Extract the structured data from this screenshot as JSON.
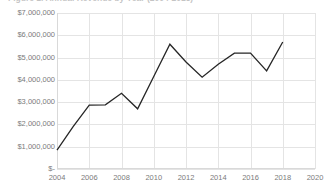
{
  "chart": {
    "title": "Figure 1. Annual Revenue by Year (2004-2018)"
  },
  "chart_data": {
    "type": "line",
    "title": "Figure 1. Annual Revenue by Year (2004-2018)",
    "xlabel": "",
    "ylabel": "",
    "grid": true,
    "legend": false,
    "xlim": [
      2004,
      2020
    ],
    "ylim": [
      0,
      7000000
    ],
    "x_tick_labels": [
      "2004",
      "2006",
      "2008",
      "2010",
      "2012",
      "2014",
      "2016",
      "2018",
      "2020"
    ],
    "x_tick_values": [
      2004,
      2006,
      2008,
      2010,
      2012,
      2014,
      2016,
      2018,
      2020
    ],
    "y_tick_labels": [
      "$-",
      "$1,000,000",
      "$2,000,000",
      "$3,000,000",
      "$4,000,000",
      "$5,000,000",
      "$6,000,000",
      "$7,000,000"
    ],
    "y_tick_values": [
      0,
      1000000,
      2000000,
      3000000,
      4000000,
      5000000,
      6000000,
      7000000
    ],
    "series": [
      {
        "name": "Revenue",
        "color": "#262626",
        "x": [
          2004,
          2005,
          2006,
          2007,
          2008,
          2009,
          2010,
          2011,
          2012,
          2013,
          2014,
          2015,
          2016,
          2017,
          2018
        ],
        "values": [
          850000,
          1900000,
          2870000,
          2880000,
          3400000,
          2700000,
          4150000,
          5600000,
          4800000,
          4120000,
          4700000,
          5200000,
          5200000,
          4400000,
          5700000
        ]
      }
    ]
  }
}
